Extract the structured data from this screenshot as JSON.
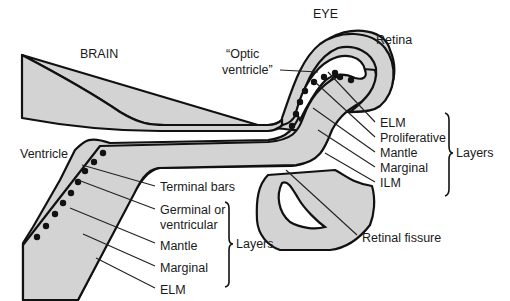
{
  "diagram": {
    "regions": {
      "brain_label": "BRAIN",
      "eye_label": "EYE",
      "retina_label": "Retina",
      "optic_ventricle_label_line1": "“Optic",
      "optic_ventricle_label_line2": "ventricle”",
      "ventricle_label": "Ventricle"
    },
    "brain_labels": {
      "terminal_bars": "Terminal bars",
      "germinal_line1": "Germinal or",
      "germinal_line2": "ventricular",
      "mantle": "Mantle",
      "marginal": "Marginal",
      "elm": "ELM",
      "layers_label": "Layers"
    },
    "eye_labels": {
      "elm": "ELM",
      "proliferative": "Proliferative",
      "mantle": "Mantle",
      "marginal": "Marginal",
      "ilm": "ILM",
      "layers_label": "Layers",
      "retinal_fissure": "Retinal fissure"
    },
    "colors": {
      "tissue_fill": "#d3d3d3",
      "outline": "#111111",
      "background": "#ffffff"
    }
  }
}
